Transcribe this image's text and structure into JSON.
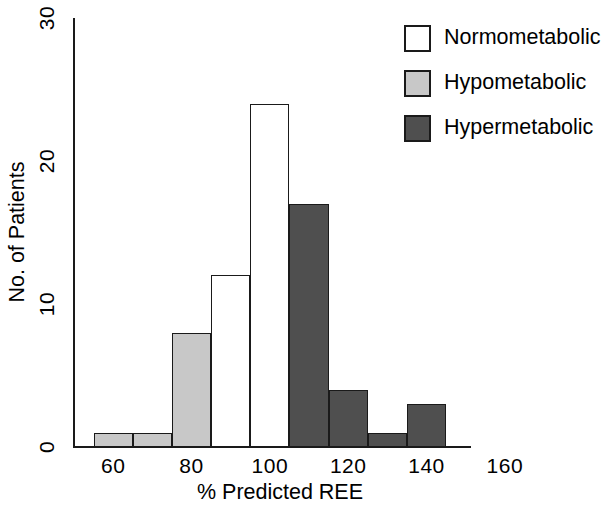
{
  "chart_data": {
    "type": "bar",
    "subtype": "histogram",
    "title": "",
    "xlabel": "% Predicted REE",
    "ylabel": "No. of Patients",
    "xlim": [
      50,
      170
    ],
    "ylim": [
      0,
      30
    ],
    "xticks": [
      "60",
      "80",
      "100",
      "120",
      "140",
      "160"
    ],
    "xtick_values": [
      60,
      80,
      100,
      120,
      140,
      160
    ],
    "yticks": [
      "0",
      "10",
      "20",
      "30"
    ],
    "ytick_values": [
      0,
      10,
      20,
      30
    ],
    "grid": false,
    "bin_width": 10,
    "bins": [
      {
        "x0": 55,
        "x1": 65,
        "value": 1,
        "group": "Hypometabolic",
        "color": "#c8c8c8"
      },
      {
        "x0": 65,
        "x1": 75,
        "value": 1,
        "group": "Hypometabolic",
        "color": "#c8c8c8"
      },
      {
        "x0": 75,
        "x1": 85,
        "value": 8,
        "group": "Hypometabolic",
        "color": "#c8c8c8"
      },
      {
        "x0": 85,
        "x1": 95,
        "value": 12,
        "group": "Normometabolic",
        "color": "#ffffff"
      },
      {
        "x0": 95,
        "x1": 105,
        "value": 24,
        "group": "Normometabolic",
        "color": "#ffffff"
      },
      {
        "x0": 105,
        "x1": 115,
        "value": 17,
        "group": "Hypermetabolic",
        "color": "#4f4f4f"
      },
      {
        "x0": 115,
        "x1": 125,
        "value": 4,
        "group": "Hypermetabolic",
        "color": "#4f4f4f"
      },
      {
        "x0": 125,
        "x1": 135,
        "value": 1,
        "group": "Hypermetabolic",
        "color": "#4f4f4f"
      },
      {
        "x0": 135,
        "x1": 145,
        "value": 3,
        "group": "Hypermetabolic",
        "color": "#4f4f4f"
      }
    ],
    "legend": {
      "position": "top-right",
      "entries": [
        {
          "label": "Normometabolic",
          "color": "#ffffff",
          "swatch": "swatch-white"
        },
        {
          "label": "Hypometabolic",
          "color": "#c8c8c8",
          "swatch": "swatch-light"
        },
        {
          "label": "Hypermetabolic",
          "color": "#4f4f4f",
          "swatch": "swatch-dark"
        }
      ]
    }
  }
}
